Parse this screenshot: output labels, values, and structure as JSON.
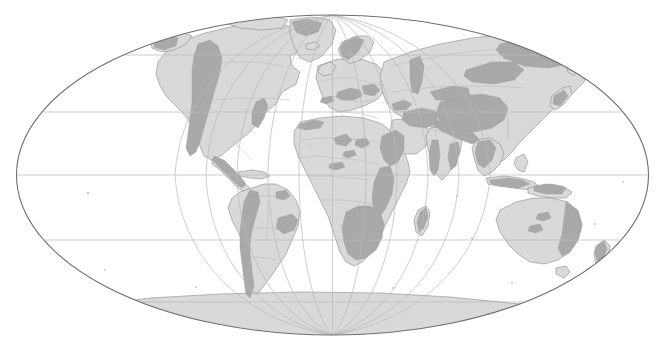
{
  "map": {
    "title": "World map of mountain and highland distribution",
    "projection": "Mollweide",
    "canvas": {
      "width": 665,
      "height": 347
    },
    "background_color": "#ffffff",
    "ellipse": {
      "cx": 332.5,
      "cy": 175,
      "rx": 316,
      "ry": 160
    },
    "colors": {
      "ocean": "#ffffff",
      "land_fill": "#d9d9d9",
      "highland_fill": "#a9a9a9",
      "coastline": "#8c8c8c",
      "border": "#b0b0b0",
      "graticule": "#b9b9b9",
      "outline": "#6e6e6e"
    },
    "graticule": {
      "parallel_interval_deg": 30,
      "meridian_interval_deg": 30,
      "parallels_deg": [
        60,
        30,
        0,
        -30,
        -60
      ],
      "parallels_y_px": [
        55,
        112,
        175,
        240,
        302
      ],
      "meridians_deg": [
        -180,
        -150,
        -120,
        -90,
        -60,
        -30,
        0,
        30,
        60,
        90,
        120,
        150,
        180
      ],
      "show_labels": false
    },
    "legend": {
      "visible": false
    },
    "labels": {
      "visible": false,
      "items": []
    },
    "regions": [
      {
        "name": "North America",
        "has_highlands": true,
        "highland_areas": [
          "Rocky Mountains",
          "Sierra Madre",
          "Appalachians",
          "Canadian Arctic"
        ]
      },
      {
        "name": "South America",
        "has_highlands": true,
        "highland_areas": [
          "Andes",
          "Brazilian Highlands",
          "Guiana Highlands"
        ]
      },
      {
        "name": "Europe",
        "has_highlands": true,
        "highland_areas": [
          "Alps",
          "Scandinavian Mountains",
          "Carpathians",
          "Pyrenees"
        ]
      },
      {
        "name": "Africa",
        "has_highlands": true,
        "highland_areas": [
          "Atlas",
          "Ahaggar",
          "Tibesti",
          "Ethiopian Highlands",
          "East African Rift",
          "Drakensberg",
          "Southern African Plateau"
        ]
      },
      {
        "name": "Asia",
        "has_highlands": true,
        "highland_areas": [
          "Tibetan Plateau",
          "Himalaya",
          "Tian Shan",
          "Altai",
          "Siberian Ranges",
          "Kamchatka",
          "Caucasus",
          "Iranian Plateau"
        ]
      },
      {
        "name": "Australia",
        "has_highlands": true,
        "highland_areas": [
          "Great Dividing Range",
          "MacDonnell Ranges",
          "Musgrave Ranges"
        ]
      },
      {
        "name": "Antarctica",
        "has_highlands": false,
        "highland_areas": []
      },
      {
        "name": "Greenland",
        "has_highlands": true,
        "highland_areas": [
          "Coastal Ranges"
        ]
      }
    ]
  },
  "chart_data": {
    "type": "map",
    "projection": "Mollweide",
    "legend_entries": [
      {
        "label": "Lowland / plains",
        "color": "#d9d9d9"
      },
      {
        "label": "Mountains / highlands",
        "color": "#a9a9a9"
      }
    ],
    "axis_ranges": {
      "longitude": [
        -180,
        180
      ],
      "latitude": [
        -90,
        90
      ]
    },
    "grid": true
  }
}
